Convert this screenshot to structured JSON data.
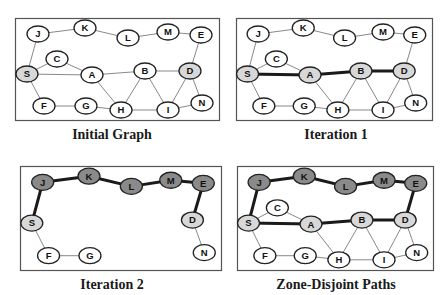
{
  "colors": {
    "background": "#ffffff",
    "box_border": "#555555",
    "thin_edge": "#7a7a7a",
    "thick_edge": "#1a1a1a",
    "node_white": "#ffffff",
    "node_light": "#d8d8d8",
    "node_dark": "#8a8a8a",
    "node_stroke": "#222222"
  },
  "nodes": {
    "J": [
      23,
      16
    ],
    "K": [
      70,
      10
    ],
    "L": [
      113,
      20
    ],
    "M": [
      153,
      14
    ],
    "E": [
      186,
      17
    ],
    "C": [
      42,
      41
    ],
    "S": [
      12,
      56
    ],
    "A": [
      77,
      57
    ],
    "B": [
      130,
      53
    ],
    "D": [
      175,
      53
    ],
    "F": [
      29,
      88
    ],
    "G": [
      71,
      88
    ],
    "H": [
      106,
      92
    ],
    "I": [
      153,
      92
    ],
    "N": [
      187,
      85
    ]
  },
  "panels": [
    {
      "id": "initial-graph",
      "caption": "Initial Graph",
      "box": [
        15,
        18,
        205,
        103
      ],
      "caption_pos": [
        0,
        127
      ],
      "nodes": [
        "J",
        "K",
        "L",
        "M",
        "E",
        "C",
        "S",
        "A",
        "B",
        "D",
        "F",
        "G",
        "H",
        "I",
        "N"
      ],
      "light_nodes": [
        "S",
        "D"
      ],
      "dark_nodes": [],
      "thin_edges": [
        [
          "J",
          "K"
        ],
        [
          "K",
          "L"
        ],
        [
          "L",
          "M"
        ],
        [
          "M",
          "E"
        ],
        [
          "E",
          "D"
        ],
        [
          "J",
          "S"
        ],
        [
          "S",
          "C"
        ],
        [
          "C",
          "A"
        ],
        [
          "S",
          "A"
        ],
        [
          "A",
          "B"
        ],
        [
          "B",
          "D"
        ],
        [
          "S",
          "F"
        ],
        [
          "F",
          "G"
        ],
        [
          "G",
          "H"
        ],
        [
          "A",
          "H"
        ],
        [
          "H",
          "B"
        ],
        [
          "H",
          "I"
        ],
        [
          "B",
          "I"
        ],
        [
          "I",
          "D"
        ],
        [
          "I",
          "N"
        ],
        [
          "D",
          "N"
        ]
      ],
      "thick_edges": []
    },
    {
      "id": "iteration-1",
      "caption": "Iteration 1",
      "box": [
        236,
        18,
        197,
        103
      ],
      "caption_pos": [
        224,
        127
      ],
      "nodes": [
        "J",
        "K",
        "L",
        "M",
        "E",
        "C",
        "S",
        "A",
        "B",
        "D",
        "F",
        "G",
        "H",
        "I",
        "N"
      ],
      "light_nodes": [
        "S",
        "A",
        "B",
        "D"
      ],
      "dark_nodes": [],
      "thin_edges": [
        [
          "J",
          "K"
        ],
        [
          "K",
          "L"
        ],
        [
          "L",
          "M"
        ],
        [
          "M",
          "E"
        ],
        [
          "E",
          "D"
        ],
        [
          "J",
          "S"
        ],
        [
          "S",
          "C"
        ],
        [
          "C",
          "A"
        ],
        [
          "S",
          "F"
        ],
        [
          "F",
          "G"
        ],
        [
          "G",
          "H"
        ],
        [
          "A",
          "H"
        ],
        [
          "H",
          "B"
        ],
        [
          "H",
          "I"
        ],
        [
          "B",
          "I"
        ],
        [
          "I",
          "D"
        ],
        [
          "I",
          "N"
        ],
        [
          "D",
          "N"
        ]
      ],
      "thick_edges": [
        [
          "S",
          "A"
        ],
        [
          "A",
          "B"
        ],
        [
          "B",
          "D"
        ]
      ]
    },
    {
      "id": "iteration-2",
      "caption": "Iteration 2",
      "box": [
        20,
        166,
        202,
        105
      ],
      "caption_pos": [
        0,
        277
      ],
      "nodes": [
        "J",
        "K",
        "L",
        "M",
        "E",
        "S",
        "D",
        "F",
        "G",
        "N"
      ],
      "light_nodes": [
        "S",
        "D"
      ],
      "dark_nodes": [
        "J",
        "K",
        "L",
        "M",
        "E"
      ],
      "thin_edges": [
        [
          "S",
          "F"
        ],
        [
          "F",
          "G"
        ],
        [
          "D",
          "N"
        ]
      ],
      "thick_edges": [
        [
          "S",
          "J"
        ],
        [
          "J",
          "K"
        ],
        [
          "K",
          "L"
        ],
        [
          "L",
          "M"
        ],
        [
          "M",
          "E"
        ],
        [
          "E",
          "D"
        ]
      ]
    },
    {
      "id": "zone-disjoint-paths",
      "caption": "Zone-Disjoint Paths",
      "box": [
        237,
        166,
        197,
        105
      ],
      "caption_pos": [
        224,
        277
      ],
      "nodes": [
        "J",
        "K",
        "L",
        "M",
        "E",
        "C",
        "S",
        "A",
        "B",
        "D",
        "F",
        "G",
        "H",
        "I",
        "N"
      ],
      "light_nodes": [
        "S",
        "A",
        "B",
        "D"
      ],
      "dark_nodes": [
        "J",
        "K",
        "L",
        "M",
        "E"
      ],
      "thin_edges": [
        [
          "S",
          "C"
        ],
        [
          "C",
          "A"
        ],
        [
          "S",
          "F"
        ],
        [
          "F",
          "G"
        ],
        [
          "G",
          "H"
        ],
        [
          "A",
          "H"
        ],
        [
          "H",
          "B"
        ],
        [
          "H",
          "I"
        ],
        [
          "B",
          "I"
        ],
        [
          "I",
          "D"
        ],
        [
          "I",
          "N"
        ],
        [
          "D",
          "N"
        ]
      ],
      "thick_edges": [
        [
          "S",
          "J"
        ],
        [
          "J",
          "K"
        ],
        [
          "K",
          "L"
        ],
        [
          "L",
          "M"
        ],
        [
          "M",
          "E"
        ],
        [
          "E",
          "D"
        ],
        [
          "S",
          "A"
        ],
        [
          "A",
          "B"
        ],
        [
          "B",
          "D"
        ]
      ]
    }
  ]
}
